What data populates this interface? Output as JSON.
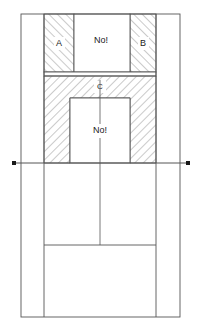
{
  "drawing": {
    "title": "Sectional technical drawing",
    "background_color": "#ffffff",
    "line_color": "#555555",
    "hatch_color": "#8a8a8a",
    "text_color": "#1a1a1a",
    "outer_frame": {
      "x": 21,
      "y": 14,
      "width": 159,
      "height": 303
    },
    "datum_line": {
      "y": 163,
      "x_start": 14,
      "x_end": 188,
      "marker_shape": "square",
      "marker_size": 4
    },
    "centerline": {
      "x": 100,
      "y_start": 80,
      "y_end": 245
    },
    "inner_verticals": [
      {
        "x": 44,
        "y_start": 14,
        "y_end": 317
      },
      {
        "x": 156,
        "y_start": 14,
        "y_end": 317
      }
    ],
    "lower_divider": {
      "y": 245,
      "x_start": 44,
      "x_end": 156
    },
    "hatched_blocks": [
      {
        "name": "block-a",
        "label": "A",
        "x": 44,
        "y": 14,
        "width": 30,
        "height": 58,
        "label_x": 59,
        "label_y": 44
      },
      {
        "name": "block-b",
        "label": "B",
        "x": 130,
        "y": 14,
        "width": 26,
        "height": 58,
        "label_x": 143,
        "label_y": 44
      },
      {
        "name": "block-c",
        "label": "C",
        "x": 44,
        "y": 76,
        "width": 112,
        "height": 87,
        "label_x": 100,
        "label_y": 87
      }
    ],
    "cavity": {
      "name": "inner-cavity",
      "x": 70,
      "y": 98,
      "width": 60,
      "height": 65
    },
    "top_opening": {
      "name": "top-opening",
      "x": 74,
      "y": 14,
      "width": 56,
      "height": 58
    },
    "gap_band": {
      "name": "gap-band",
      "x": 44,
      "y": 72,
      "width": 112,
      "height": 4
    },
    "annotations": [
      {
        "name": "annotation-top",
        "text": "No!",
        "x": 101,
        "y": 41
      },
      {
        "name": "annotation-inner",
        "text": "No!",
        "x": 100,
        "y": 131
      }
    ]
  }
}
